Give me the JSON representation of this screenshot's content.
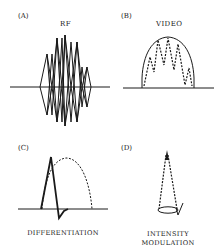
{
  "figure": {
    "panels": [
      {
        "id": "(A)",
        "title": "RF",
        "caption": ""
      },
      {
        "id": "(B)",
        "title": "VIDEO",
        "caption": ""
      },
      {
        "id": "(C)",
        "title": "",
        "caption": "DIFFERENTIATION"
      },
      {
        "id": "(D)",
        "title": "",
        "caption_line1": "INTENSITY",
        "caption_line2": "MODULATION"
      }
    ],
    "colors": {
      "ink": "#1a1a1a",
      "background": "#ffffff"
    }
  }
}
